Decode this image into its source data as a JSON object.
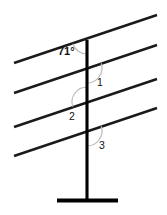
{
  "figure": {
    "type": "geometry-diagram",
    "width": 167,
    "height": 215,
    "background_color": "#ffffff"
  },
  "colors": {
    "line_stroke": "#1a1a1a",
    "vertical_stroke": "#000000",
    "arc_stroke": "#b9b9b9",
    "label_text": "#111111"
  },
  "labels": {
    "angle_71": "71°",
    "angle_1": "1",
    "angle_2": "2",
    "angle_3": "3"
  },
  "chart_data": {
    "type": "scatter",
    "title": "",
    "xlabel": "",
    "ylabel": "",
    "grid": false,
    "legend": null,
    "xlim": [
      0,
      167
    ],
    "ylim": [
      0,
      215
    ],
    "annotations": [
      {
        "text": "71°",
        "x": 62,
        "y": 52
      },
      {
        "text": "1",
        "x": 98,
        "y": 83
      },
      {
        "text": "2",
        "x": 72,
        "y": 117
      },
      {
        "text": "3",
        "x": 100,
        "y": 146
      }
    ],
    "series": [
      {
        "name": "parallel-line-1",
        "x": [
          14,
          157
        ],
        "y": [
          63,
          15
        ]
      },
      {
        "name": "parallel-line-2",
        "x": [
          14,
          157
        ],
        "y": [
          93,
          45
        ]
      },
      {
        "name": "parallel-line-3",
        "x": [
          14,
          157
        ],
        "y": [
          127,
          79
        ]
      },
      {
        "name": "parallel-line-4",
        "x": [
          14,
          157
        ],
        "y": [
          156,
          108
        ]
      },
      {
        "name": "vertical-post",
        "x": [
          87,
          87
        ],
        "y": [
          40,
          200
        ]
      },
      {
        "name": "base-bar",
        "x": [
          57,
          118
        ],
        "y": [
          200,
          200
        ]
      }
    ]
  },
  "geometry": {
    "transversals": [
      {
        "name": "line-1",
        "x1": 14,
        "y1": 63,
        "x2": 157,
        "y2": 15
      },
      {
        "name": "line-2",
        "x1": 14,
        "y1": 93,
        "x2": 157,
        "y2": 45
      },
      {
        "name": "line-3",
        "x1": 14,
        "y1": 127,
        "x2": 157,
        "y2": 79
      },
      {
        "name": "line-4",
        "x1": 14,
        "y1": 156,
        "x2": 157,
        "y2": 108
      }
    ],
    "vertical": {
      "name": "vertical-post",
      "x1": 87,
      "y1": 40,
      "x2": 87,
      "y2": 200
    },
    "base": {
      "name": "base-bar",
      "x1": 57,
      "y1": 200,
      "x2": 118,
      "y2": 200
    },
    "intersections": [
      {
        "name": "intersection-1",
        "x": 87,
        "y": 39
      },
      {
        "name": "intersection-2",
        "x": 87,
        "y": 68
      },
      {
        "name": "intersection-3",
        "x": 87,
        "y": 102
      },
      {
        "name": "intersection-4",
        "x": 87,
        "y": 131
      }
    ],
    "arcs": [
      {
        "name": "arc-71",
        "cx": 87,
        "cy": 39,
        "r": 15,
        "side": "left-below"
      },
      {
        "name": "arc-1",
        "cx": 87,
        "cy": 68,
        "r": 15,
        "side": "right-below"
      },
      {
        "name": "arc-2",
        "cx": 87,
        "cy": 102,
        "r": 15,
        "side": "left-above"
      },
      {
        "name": "arc-3",
        "cx": 87,
        "cy": 131,
        "r": 15,
        "side": "right-below"
      }
    ]
  }
}
